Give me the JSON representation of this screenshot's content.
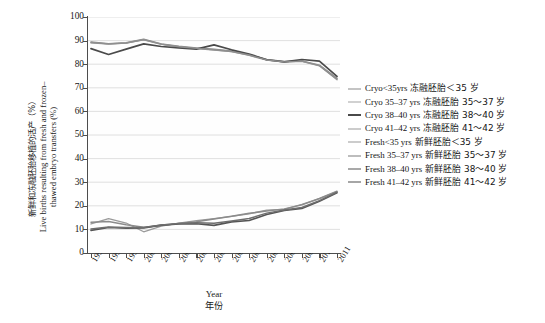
{
  "chart_data": {
    "type": "line",
    "title": "",
    "xlabel_en": "Year",
    "xlabel_cn": "年份",
    "ylabel_cn": "新鲜和冻融胚胎移植的活产（%）",
    "ylabel_en_line1": "Live births resulting from fresh and frozen–",
    "ylabel_en_line2": "thawed embryo transfers (%)",
    "x": [
      1997,
      1998,
      1999,
      2000,
      2001,
      2002,
      2003,
      2004,
      2005,
      2006,
      2007,
      2008,
      2009,
      2010,
      2011
    ],
    "xtick_labels": [
      "1997",
      "1998",
      "1999",
      "2000",
      "2001",
      "2002",
      "2003",
      "2004",
      "2005",
      "2006",
      "2007",
      "2008",
      "2009",
      "2010",
      "2011"
    ],
    "ylim": [
      0,
      100
    ],
    "yticks": [
      0,
      10,
      20,
      30,
      40,
      50,
      60,
      70,
      80,
      90,
      100
    ],
    "ytick_labels": [
      "0",
      "10",
      "20",
      "30",
      "40",
      "50",
      "60",
      "70",
      "80",
      "90",
      "100"
    ],
    "grid": true,
    "grid_axis": "y",
    "legend_position": "right",
    "series": [
      {
        "name": "Cryo<35yrs",
        "name_cn": "冻融胚胎＜35 岁",
        "color": "#8a8a8a",
        "width": 1.5,
        "values": [
          89.4,
          88.7,
          89.1,
          90.6,
          88.6,
          87.6,
          86.9,
          86.3,
          85.6,
          84.0,
          82.0,
          81.1,
          81.4,
          79.6,
          74.0
        ]
      },
      {
        "name": "Cryo 35–37 yrs",
        "name_cn": "冻融胚胎 35～37 岁",
        "color": "#9c9c9c",
        "width": 1.3,
        "values": [
          89.0,
          88.5,
          88.9,
          90.3,
          88.4,
          87.3,
          86.6,
          86.0,
          85.3,
          83.7,
          81.7,
          80.9,
          81.2,
          79.3,
          73.4
        ]
      },
      {
        "name": "Cryo 38–40 yrs",
        "name_cn": "冻融胚胎 38～40 岁",
        "color": "#4a4a4a",
        "width": 1.7,
        "values": [
          86.6,
          84.1,
          86.4,
          88.6,
          87.5,
          86.9,
          86.4,
          88.2,
          86.1,
          84.3,
          81.9,
          81.0,
          82.0,
          81.3,
          74.8
        ]
      },
      {
        "name": "Cryo 41–42 yrs",
        "name_cn": "冻融胚胎 41～42 岁",
        "color": "#8f8f8f",
        "width": 1.4,
        "values": [
          89.2,
          88.6,
          89.0,
          90.4,
          88.5,
          87.4,
          86.7,
          86.1,
          85.4,
          83.9,
          81.8,
          81.0,
          81.3,
          79.4,
          73.7
        ]
      },
      {
        "name": "Fresh<35 yrs",
        "name_cn": "新鲜胚胎＜35 岁",
        "color": "#9a9a9a",
        "width": 1.3,
        "values": [
          12.3,
          14.6,
          12.7,
          9.0,
          11.4,
          12.7,
          13.7,
          14.6,
          15.5,
          16.6,
          18.2,
          18.5,
          20.6,
          23.0,
          26.0
        ]
      },
      {
        "name": "Fresh 35–37 yrs",
        "name_cn": "新鲜胚胎 35～37 岁",
        "color": "#8b8b8b",
        "width": 1.5,
        "values": [
          13.0,
          13.3,
          12.0,
          10.9,
          11.6,
          12.5,
          13.2,
          14.4,
          15.6,
          16.8,
          17.8,
          18.7,
          20.4,
          23.1,
          26.2
        ]
      },
      {
        "name": "Fresh 38–40 yrs",
        "name_cn": "新鲜胚胎 38～40 岁",
        "color": "#555555",
        "width": 1.6,
        "values": [
          9.6,
          10.8,
          10.5,
          10.6,
          11.8,
          12.3,
          12.4,
          11.7,
          13.2,
          13.8,
          16.3,
          18.0,
          18.9,
          21.9,
          25.5
        ]
      },
      {
        "name": "Fresh 41–42 yrs",
        "name_cn": "新鲜胚胎 41～42 岁",
        "color": "#6e6e6e",
        "width": 1.5,
        "values": [
          10.2,
          11.0,
          10.8,
          10.8,
          11.9,
          12.5,
          12.8,
          12.6,
          13.6,
          14.6,
          16.9,
          18.2,
          19.3,
          22.2,
          25.8
        ]
      }
    ]
  },
  "legend": {
    "items": [
      {
        "label_en": "Cryo<35yrs",
        "label_cn": "冻融胚胎＜35 岁",
        "color": "#8a8a8a",
        "width": 1.6
      },
      {
        "label_en": "Cryo 35–37 yrs",
        "label_cn": "冻融胚胎 35～37 岁",
        "color": "#a3a3a3",
        "width": 1.2
      },
      {
        "label_en": "Cryo 38–40 yrs",
        "label_cn": "冻融胚胎 38～40 岁",
        "color": "#4a4a4a",
        "width": 2.0
      },
      {
        "label_en": "Cryo 41–42 yrs",
        "label_cn": "冻融胚胎 41～42 岁",
        "color": "#999999",
        "width": 1.3
      },
      {
        "label_en": "Fresh<35 yrs",
        "label_cn": "新鲜胚胎＜35 岁",
        "color": "#9a9a9a",
        "width": 1.3
      },
      {
        "label_en": "Fresh 35–37 yrs",
        "label_cn": "新鲜胚胎 35～37 岁",
        "color": "#7d7d7d",
        "width": 1.7
      },
      {
        "label_en": "Fresh 38–40 yrs",
        "label_cn": "新鲜胚胎 38～40 岁",
        "color": "#555555",
        "width": 1.9
      },
      {
        "label_en": "Fresh 41–42 yrs",
        "label_cn": "新鲜胚胎 41～42 岁",
        "color": "#4f4f4f",
        "width": 1.9
      }
    ]
  }
}
